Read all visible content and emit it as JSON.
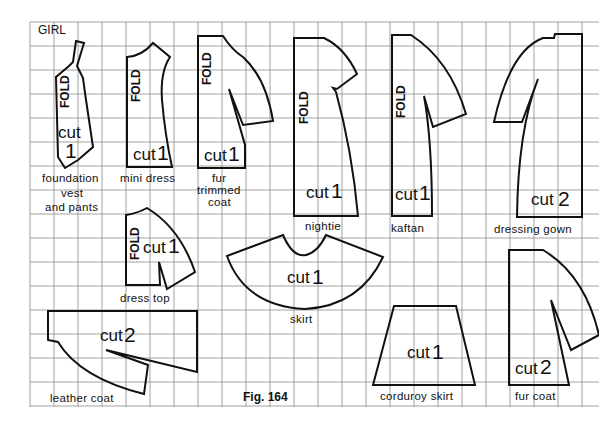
{
  "diagram": {
    "title": "GIRL",
    "figure_label": "Fig. 164",
    "grid": {
      "x_start": 30,
      "x_end": 599,
      "y_start": 22,
      "y_end": 407,
      "spacing": 24,
      "line_color": "#8a8a8a"
    },
    "fold_label": "FOLD",
    "pieces": [
      {
        "id": "foundation-vest",
        "name_lines": [
          "foundation",
          "vest",
          "and pants"
        ],
        "cut_text": "cut",
        "cut_count": "1",
        "has_fold": true
      },
      {
        "id": "mini-dress",
        "name_lines": [
          "mini dress"
        ],
        "cut_text": "cut",
        "cut_count": "1",
        "has_fold": true
      },
      {
        "id": "fur-trimmed-coat",
        "name_lines": [
          "fur",
          "trimmed",
          "coat"
        ],
        "cut_text": "cut",
        "cut_count": "1",
        "has_fold": true
      },
      {
        "id": "nightie",
        "name_lines": [
          "nightie"
        ],
        "cut_text": "cut",
        "cut_count": "1",
        "has_fold": true
      },
      {
        "id": "kaftan",
        "name_lines": [
          "kaftan"
        ],
        "cut_text": "cut",
        "cut_count": "1",
        "has_fold": true
      },
      {
        "id": "dressing-gown",
        "name_lines": [
          "dressing gown"
        ],
        "cut_text": "cut",
        "cut_count": "2",
        "has_fold": false
      },
      {
        "id": "dress-top",
        "name_lines": [
          "dress top"
        ],
        "cut_text": "cut",
        "cut_count": "1",
        "has_fold": true
      },
      {
        "id": "skirt",
        "name_lines": [
          "skirt"
        ],
        "cut_text": "cut",
        "cut_count": "1",
        "has_fold": false
      },
      {
        "id": "leather-coat",
        "name_lines": [
          "leather coat"
        ],
        "cut_text": "cut",
        "cut_count": "2",
        "has_fold": false
      },
      {
        "id": "corduroy-skirt",
        "name_lines": [
          "corduroy skirt"
        ],
        "cut_text": "cut",
        "cut_count": "1",
        "has_fold": false
      },
      {
        "id": "fur-coat",
        "name_lines": [
          "fur coat"
        ],
        "cut_text": "cut",
        "cut_count": "2",
        "has_fold": false
      }
    ]
  }
}
